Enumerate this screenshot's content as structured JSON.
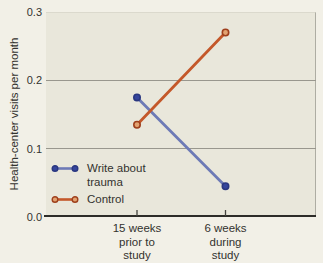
{
  "figure": {
    "bg_color": "#f2f0e7",
    "plot_bg_color": "#e9e7db",
    "grid_color": "#99978e",
    "axis_color": "#2d2c28",
    "text_color": "#33322e"
  },
  "chart_data": {
    "type": "line",
    "title": "",
    "xlabel": "",
    "ylabel": "Health-center visits per month",
    "ylim": [
      0,
      0.3
    ],
    "yticks": [
      "0.0",
      "0.1",
      "0.2",
      "0.3"
    ],
    "grid": "horizontal gridlines at 0.1 and 0.2",
    "legend_position": "lower-left inside plot",
    "categories": [
      "15 weeks prior to study",
      "6 weeks during study"
    ],
    "category_label_lines": [
      [
        "15 weeks",
        "prior to",
        "study"
      ],
      [
        "6 weeks",
        "during",
        "study"
      ]
    ],
    "series": [
      {
        "name": "Write about trauma",
        "color": "#6d7ab6",
        "marker_fill": "#35459c",
        "marker_stroke": "#2a3780",
        "values": [
          0.175,
          0.045
        ]
      },
      {
        "name": "Control",
        "color": "#c4582a",
        "marker_fill": "#e2a271",
        "marker_stroke": "#9e3f1c",
        "values": [
          0.135,
          0.27
        ]
      }
    ]
  }
}
